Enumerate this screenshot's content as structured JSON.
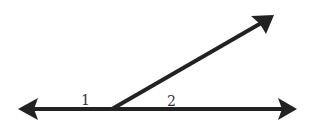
{
  "diagram": {
    "type": "angle-pair",
    "labels": {
      "angle1": "1",
      "angle2": "2"
    },
    "colors": {
      "stroke": "#222222",
      "background": "#ffffff"
    }
  }
}
